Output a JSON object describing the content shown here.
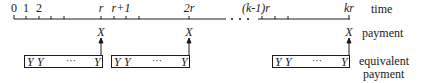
{
  "timeline": {
    "label": "time",
    "tick_labels": [
      {
        "text": "0",
        "x": 14,
        "italic": false
      },
      {
        "text": "1",
        "x": 26,
        "italic": false
      },
      {
        "text": "2",
        "x": 39,
        "italic": false
      },
      {
        "text": "r",
        "x": 101,
        "italic": true
      },
      {
        "text": "r+1",
        "x": 114,
        "italic": true
      },
      {
        "text": "2r",
        "x": 189,
        "italic": true
      },
      {
        "text": "(k-1)r",
        "x": 262,
        "italic": true
      },
      {
        "text": "kr",
        "x": 349,
        "italic": true
      }
    ],
    "ellipsis": "• • •"
  },
  "payments": {
    "label": "payment",
    "symbol": "X",
    "positions": [
      "r",
      "2r",
      "kr"
    ]
  },
  "equivalent": {
    "label_line1": "equivalent",
    "label_line2": "payment",
    "boxes": [
      {
        "y1": "Y",
        "y2": "Y",
        "dots": "···",
        "ylast": "Y"
      },
      {
        "y1": "Y",
        "y2": "Y",
        "dots": "···",
        "ylast": "Y"
      },
      {
        "y1": "Y",
        "y2": "Y",
        "dots": "···",
        "ylast": "Y"
      }
    ]
  },
  "colors": {
    "ink": "#1a1a1a",
    "background": "#ffffff"
  }
}
